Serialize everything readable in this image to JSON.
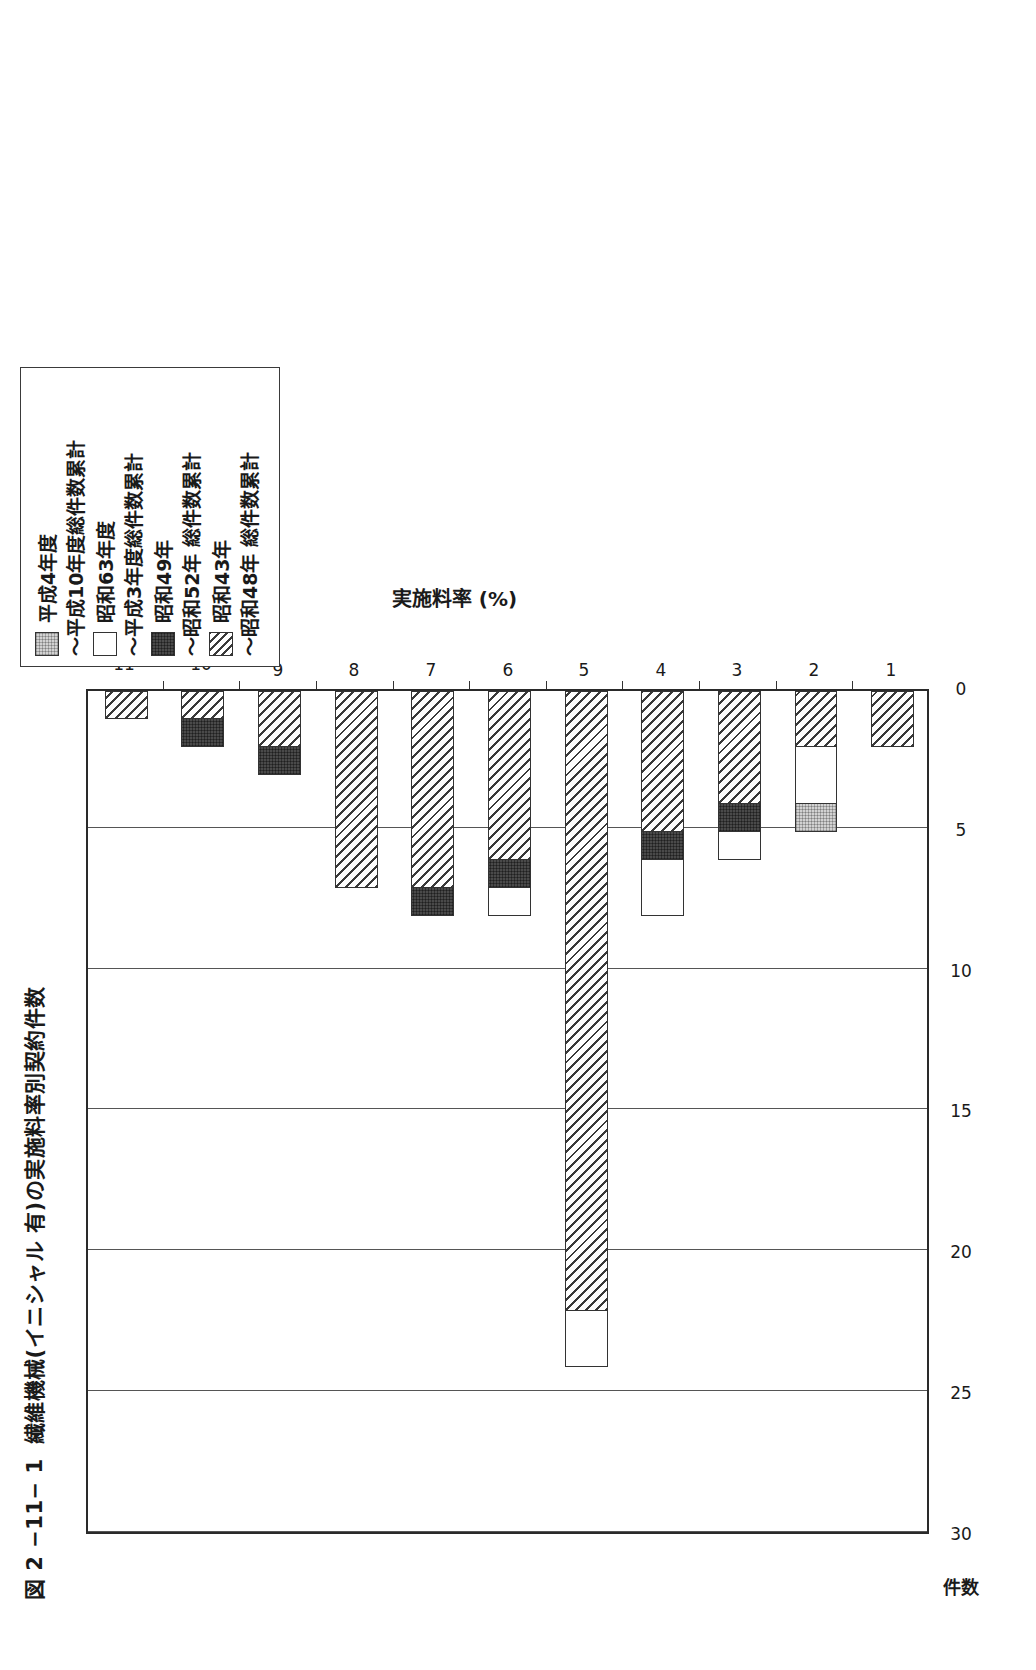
{
  "figure": {
    "number": "図 2 −11− 1",
    "title": "繊維機械(イニシャル 有)の実施料率別契約件数"
  },
  "legend": {
    "position": "top-right",
    "entries": [
      {
        "label": "平成4年度\n〜平成10年度総件数累計",
        "label_line1": "平成4年度",
        "label_line2": "〜平成10年度総件数累計",
        "swatch": "light-gray-dotted",
        "color": "#d2d2d2"
      },
      {
        "label": "昭和63年度\n〜平成3年度総件数累計",
        "label_line1": "昭和63年度",
        "label_line2": "〜平成3年度総件数累計",
        "swatch": "white",
        "color": "#ffffff"
      },
      {
        "label": "昭和49年\n〜昭和52年 総件数累計",
        "label_line1": "昭和49年",
        "label_line2": "〜昭和52年 総件数累計",
        "swatch": "dark-dotted",
        "color": "#4a4a4a"
      },
      {
        "label": "昭和43年\n〜昭和48年 総件数累計",
        "label_line1": "昭和43年",
        "label_line2": "〜昭和48年 総件数累計",
        "swatch": "diagonal-hatch",
        "color": "#ffffff"
      }
    ]
  },
  "axes": {
    "x_label": "実施料率 (%)",
    "x_ticks": [
      "1",
      "2",
      "3",
      "4",
      "5",
      "6",
      "7",
      "8",
      "9",
      "10",
      "11"
    ],
    "y_label": "件数",
    "y_ticks": [
      "0",
      "5",
      "10",
      "15",
      "20",
      "25",
      "30"
    ]
  },
  "chart_data": {
    "type": "bar",
    "orientation": "horizontal-stacked-rotated",
    "xlabel": "実施料率 (%)",
    "ylabel": "件数",
    "ylim": [
      0,
      30
    ],
    "yticks": [
      0,
      5,
      10,
      15,
      20,
      25,
      30
    ],
    "grid": true,
    "categories": [
      "1",
      "2",
      "3",
      "4",
      "5",
      "6",
      "7",
      "8",
      "9",
      "10",
      "11"
    ],
    "series": [
      {
        "name": "昭和43年〜昭和48年 総件数累計",
        "fill": "diagonal-hatch",
        "values": [
          2,
          2,
          4,
          5,
          22,
          6,
          7,
          7,
          2,
          1,
          1
        ]
      },
      {
        "name": "昭和49年〜昭和52年 総件数累計",
        "fill": "dark-dotted",
        "values": [
          0,
          0,
          1,
          1,
          0,
          1,
          1,
          0,
          1,
          1,
          0
        ]
      },
      {
        "name": "昭和63年度〜平成3年度総件数累計",
        "fill": "white",
        "values": [
          0,
          2,
          1,
          2,
          2,
          1,
          0,
          0,
          0,
          0,
          0
        ]
      },
      {
        "name": "平成4年度〜平成10年度総件数累計",
        "fill": "light-gray-dotted",
        "values": [
          0,
          1,
          0,
          0,
          0,
          0,
          0,
          0,
          0,
          0,
          0
        ]
      }
    ],
    "totals": [
      2,
      5,
      6,
      8,
      24,
      8,
      8,
      7,
      3,
      2,
      1
    ]
  }
}
